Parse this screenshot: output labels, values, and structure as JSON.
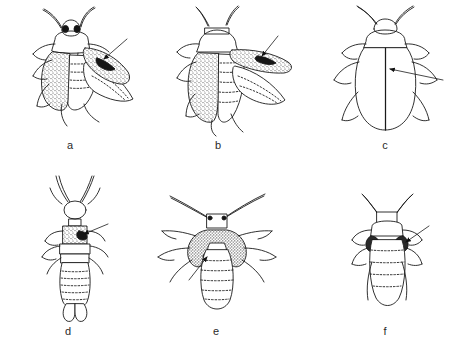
{
  "figure": {
    "type": "scientific-line-drawing-plate",
    "domain": "entomology",
    "background_color": "#ffffff",
    "ink_color": "#1a1a1a",
    "stipple_color": "#555555",
    "width": 462,
    "height": 354,
    "panel_count": 6,
    "caption_font_size": 11
  },
  "panels": [
    {
      "id": "a",
      "label": "a",
      "label_x": 70,
      "label_y": 150,
      "subject": "beetle-dorsal-with-spread-elytron",
      "orientation": "dorsal",
      "center_x": 80,
      "center_y": 72,
      "features": {
        "eyes": "two dark eyes on head",
        "antennae": 2,
        "legs": 6,
        "stippled_regions": [
          "left elytron",
          "right elytron"
        ],
        "membranous_wing": "unfolded hind wing at right",
        "arrow_count": 1,
        "arrow_target": "dark spot on right elytron",
        "arrow_from_x": 125,
        "arrow_from_y": 41,
        "arrow_to_x": 100,
        "arrow_to_y": 62
      }
    },
    {
      "id": "b",
      "label": "b",
      "label_x": 218,
      "label_y": 150,
      "subject": "beetle-dorsolateral-with-extended-elytron",
      "orientation": "dorsolateral",
      "center_x": 222,
      "center_y": 72,
      "features": {
        "antennae": 2,
        "legs": 6,
        "stippled_regions": [
          "left elytron",
          "raised right elytron"
        ],
        "membranous_wing": "folded hind wing beneath raised elytron",
        "abdomen_segments": 6,
        "arrow_count": 1,
        "arrow_target": "dark spot on raised elytron",
        "arrow_from_x": 276,
        "arrow_from_y": 38,
        "arrow_to_x": 262,
        "arrow_to_y": 58
      }
    },
    {
      "id": "c",
      "label": "c",
      "label_x": 385,
      "label_y": 150,
      "subject": "beetle-dorsal-plain-elytra",
      "orientation": "dorsal",
      "center_x": 385,
      "center_y": 72,
      "features": {
        "antennae": 2,
        "legs": 6,
        "stippled_regions": [],
        "elytral_suture": "straight median line down elytra",
        "arrow_count": 1,
        "arrow_target": "elytral suture midline",
        "arrow_from_x": 441,
        "arrow_from_y": 80,
        "arrow_to_x": 389,
        "arrow_to_y": 69
      }
    },
    {
      "id": "d",
      "label": "d",
      "label_x": 68,
      "label_y": 336,
      "subject": "earwig-nymph-dorsal-with-cerci",
      "orientation": "dorsal",
      "center_x": 75,
      "center_y": 250,
      "features": {
        "antennae": 2,
        "legs": 6,
        "stippled_regions": [
          "pronotum"
        ],
        "abdomen_segments": 8,
        "terminal_structure": "forceps-like cerci",
        "arrow_count": 1,
        "arrow_target": "dark mark on stippled pronotum",
        "arrow_from_x": 106,
        "arrow_from_y": 225,
        "arrow_to_x": 80,
        "arrow_to_y": 234
      }
    },
    {
      "id": "e",
      "label": "e",
      "label_x": 216,
      "label_y": 336,
      "subject": "nymph-dorsal-with-dark-thorax",
      "orientation": "dorsal",
      "center_x": 216,
      "center_y": 250,
      "features": {
        "antennae": 2,
        "legs": 6,
        "stippled_regions": [
          "thorax / wing pads"
        ],
        "abdomen_segments": 7,
        "arrow_count": 1,
        "arrow_target": "dark spot at edge of wing pad",
        "arrow_from_x": 192,
        "arrow_from_y": 277,
        "arrow_to_x": 209,
        "arrow_to_y": 255
      }
    },
    {
      "id": "f",
      "label": "f",
      "label_x": 385,
      "label_y": 336,
      "subject": "nymph-dorsal-small-rounded-abdomen",
      "orientation": "dorsal",
      "center_x": 388,
      "center_y": 258,
      "features": {
        "antennae": 2,
        "legs": 6,
        "stippled_regions": [
          "paired dark wing pads"
        ],
        "abdomen_segments": 5,
        "arrow_count": 1,
        "arrow_target": "right dark wing pad",
        "arrow_from_x": 427,
        "arrow_from_y": 227,
        "arrow_to_x": 404,
        "arrow_to_y": 243
      }
    }
  ]
}
